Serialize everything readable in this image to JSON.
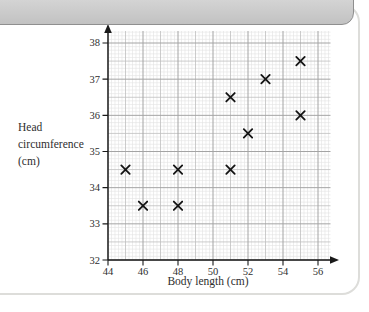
{
  "frame": {
    "header_color_top": "#dedede",
    "header_color_bottom": "#c2c2c2",
    "header_border": "#8f8f8f",
    "card_border": "#ddddda",
    "background": "#ffffff"
  },
  "chart_data": {
    "type": "scatter",
    "title": "",
    "xlabel": "Body length (cm)",
    "ylabel": "Head circumference (cm)",
    "ylabel_lines": [
      "Head",
      "circumference",
      "(cm)"
    ],
    "xlim": [
      44,
      56
    ],
    "ylim": [
      32,
      38
    ],
    "x_ticks": [
      44,
      46,
      48,
      50,
      52,
      54,
      56
    ],
    "y_ticks": [
      32,
      33,
      34,
      35,
      36,
      37,
      38
    ],
    "grid": "on",
    "grid_style": "graph-paper",
    "legend": "none",
    "marker": "x",
    "marker_color": "#141414",
    "axis_color": "#1a1a1a",
    "grid_colors": {
      "minor": "#e2e2e2",
      "medium": "#bfbfbf",
      "major": "#a4a4a4"
    },
    "points": [
      {
        "x": 45,
        "y": 34.5
      },
      {
        "x": 46,
        "y": 33.5
      },
      {
        "x": 48,
        "y": 33.5
      },
      {
        "x": 48,
        "y": 34.5
      },
      {
        "x": 51,
        "y": 34.5
      },
      {
        "x": 51,
        "y": 36.5
      },
      {
        "x": 52,
        "y": 35.5
      },
      {
        "x": 53,
        "y": 37.0
      },
      {
        "x": 55,
        "y": 36.0
      },
      {
        "x": 55,
        "y": 37.5
      }
    ]
  }
}
